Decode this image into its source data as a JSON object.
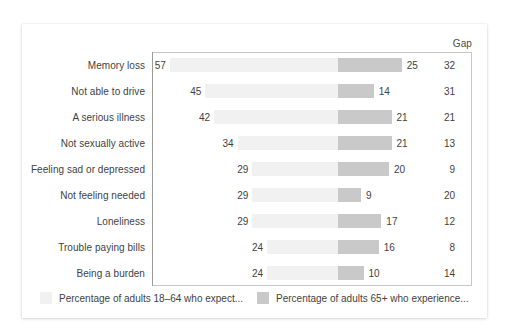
{
  "chart_data": {
    "type": "bar",
    "subtype": "diverging-paired-bar",
    "title": "",
    "xlabel": "",
    "ylabel": "",
    "grid": false,
    "legend_position": "bottom-left",
    "gap_column_header": "Gap",
    "categories": [
      "Memory loss",
      "Not able to drive",
      "A serious illness",
      "Not sexually active",
      "Feeling sad or depressed",
      "Not feeling needed",
      "Loneliness",
      "Trouble paying bills",
      "Being a burden"
    ],
    "series": [
      {
        "name": "Percentage of adults 18–64 who expect...",
        "color": "#f1f1f1",
        "side": "left",
        "values": [
          57,
          45,
          42,
          34,
          29,
          29,
          29,
          24,
          24
        ]
      },
      {
        "name": "Percentage of adults 65+ who experience...",
        "color": "#c9c9c9",
        "side": "right",
        "values": [
          25,
          14,
          21,
          21,
          20,
          9,
          17,
          16,
          10
        ]
      }
    ],
    "gap_values": [
      32,
      31,
      21,
      13,
      9,
      20,
      12,
      8,
      14
    ],
    "xlim_left": [
      0,
      60
    ],
    "xlim_right": [
      0,
      60
    ]
  },
  "legend": [
    {
      "label": "Percentage of adults 18–64 who expect...",
      "swatch": "light"
    },
    {
      "label": "Percentage of adults 65+ who experience...",
      "swatch": "dark"
    }
  ],
  "colors": {
    "series_left": "#f1f1f1",
    "series_right": "#c9c9c9",
    "text": "#3f3f3f",
    "plot_border": "#c7c7c7",
    "center_line": "#9a9a9a",
    "card_background": "#ffffff"
  }
}
